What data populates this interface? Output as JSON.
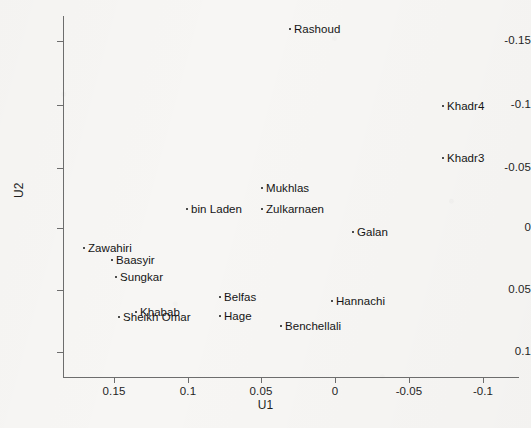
{
  "chart_data": {
    "type": "scatter",
    "title": "",
    "xlabel": "U1",
    "ylabel": "U2",
    "xlim": [
      0.175,
      -0.125
    ],
    "ylim": [
      0.125,
      -0.175
    ],
    "x_reversed": true,
    "y_reversed": true,
    "grid": false,
    "legend": "none",
    "xticks": [
      0.15,
      0.1,
      0.05,
      0,
      -0.05,
      -0.1
    ],
    "xticklabels": [
      "0.15",
      "0.1",
      "0.05",
      "0",
      "-0.05",
      "-0.1"
    ],
    "yticks": [
      -0.15,
      -0.1,
      -0.05,
      0,
      0.05,
      0.1
    ],
    "yticklabels": [
      "-0.15",
      "-0.1",
      "-0.05",
      "0",
      "0.05",
      "0.1"
    ],
    "marker": "dot",
    "marker_color": "#141414",
    "label_position": "right-of-marker",
    "points": [
      {
        "label": "Rashoud",
        "u1": 0.031,
        "u2": -0.143,
        "px": 289,
        "py": 29
      },
      {
        "label": "Khadr4",
        "u1": -0.072,
        "u2": -0.096,
        "px": 442,
        "py": 106
      },
      {
        "label": "Khadr3",
        "u1": -0.072,
        "u2": -0.055,
        "px": 442,
        "py": 158
      },
      {
        "label": "Mukhlas",
        "u1": 0.051,
        "u2": -0.026,
        "px": 261,
        "py": 188
      },
      {
        "label": "bin Laden",
        "u1": 0.103,
        "u2": -0.012,
        "px": 186,
        "py": 209
      },
      {
        "label": "Zulkarnaen",
        "u1": 0.051,
        "u2": -0.013,
        "px": 261,
        "py": 209
      },
      {
        "label": "Galan",
        "u1": -0.012,
        "u2": 0.002,
        "px": 352,
        "py": 232
      },
      {
        "label": "Zawahiri",
        "u1": 0.164,
        "u2": 0.016,
        "px": 83,
        "py": 248
      },
      {
        "label": "Baasyir",
        "u1": 0.145,
        "u2": 0.025,
        "px": 111,
        "py": 260
      },
      {
        "label": "Sungkar",
        "u1": 0.142,
        "u2": 0.039,
        "px": 115,
        "py": 277
      },
      {
        "label": "Belfas",
        "u1": 0.046,
        "u2": 0.05,
        "px": 219,
        "py": 297
      },
      {
        "label": "Hannachi",
        "u1": -0.004,
        "u2": 0.053,
        "px": 331,
        "py": 301
      },
      {
        "label": "Khabab",
        "u1": 0.116,
        "u2": 0.066,
        "px": 135,
        "py": 312
      },
      {
        "label": "Sheikh Omar",
        "u1": 0.119,
        "u2": 0.07,
        "px": 118,
        "py": 317
      },
      {
        "label": "Hage",
        "u1": 0.046,
        "u2": 0.07,
        "px": 219,
        "py": 316
      },
      {
        "label": "Benchellali",
        "u1": 0.024,
        "u2": 0.078,
        "px": 280,
        "py": 326
      }
    ]
  },
  "axes": {
    "x_title": "U1",
    "y_title": "U2",
    "x_ticks": [
      {
        "label": "0.15",
        "px": 114
      },
      {
        "label": "0.1",
        "px": 188
      },
      {
        "label": "0.05",
        "px": 261
      },
      {
        "label": "0",
        "px": 335
      },
      {
        "label": "-0.05",
        "px": 409
      },
      {
        "label": "-0.1",
        "px": 483
      }
    ],
    "y_ticks": [
      {
        "label": "-0.15",
        "py": 41
      },
      {
        "label": "-0.1",
        "py": 105
      },
      {
        "label": "-0.05",
        "py": 168
      },
      {
        "label": "0",
        "py": 228
      },
      {
        "label": "0.05",
        "py": 290
      },
      {
        "label": "0.1",
        "py": 352
      }
    ]
  }
}
